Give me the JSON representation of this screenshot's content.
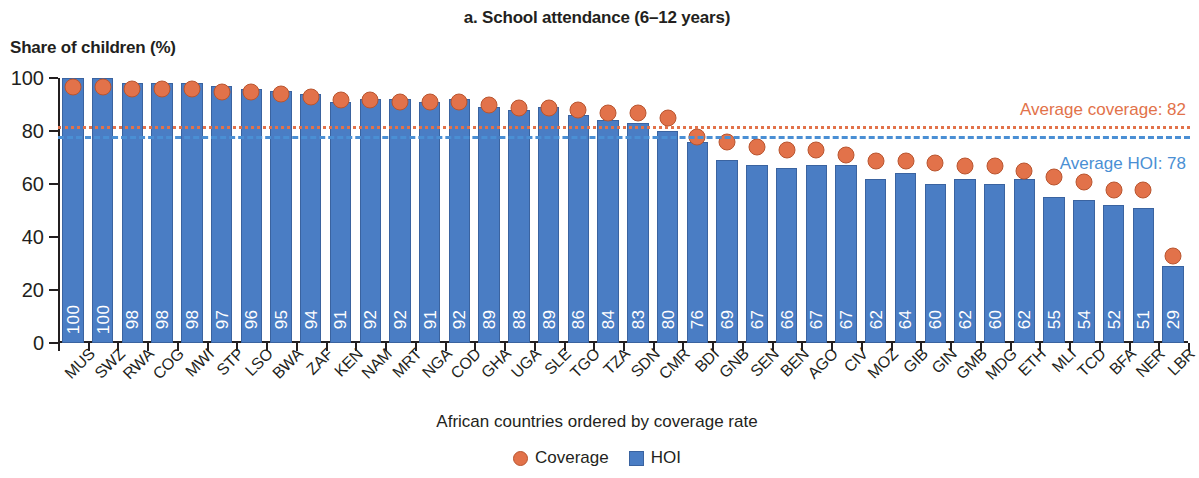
{
  "chart_data": {
    "type": "bar",
    "title": "a. School attendance (6–12 years)",
    "ylabel": "Share of children (%)",
    "xlabel": "African countries ordered by coverage rate",
    "ylim": [
      0,
      100
    ],
    "yticks": [
      0,
      20,
      40,
      60,
      80,
      100
    ],
    "grid": false,
    "legend_position": "bottom-center",
    "categories": [
      "MUS",
      "SWZ",
      "RWA",
      "COG",
      "MWI",
      "STP",
      "LSO",
      "BWA",
      "ZAF",
      "KEN",
      "NAM",
      "MRT",
      "NGA",
      "COD",
      "GHA",
      "UGA",
      "SLE",
      "TGO",
      "TZA",
      "SDN",
      "CMR",
      "BDI",
      "GNB",
      "SEN",
      "BEN",
      "AGO",
      "CIV",
      "MOZ",
      "GIB",
      "GIN",
      "GMB",
      "MDG",
      "ETH",
      "MLI",
      "TCD",
      "BFA",
      "NER",
      "LBR"
    ],
    "series": [
      {
        "name": "HOI",
        "type": "bar",
        "color": "#4a7dc4",
        "values": [
          100,
          100,
          98,
          98,
          98,
          97,
          96,
          95,
          94,
          91,
          92,
          92,
          91,
          92,
          89,
          88,
          89,
          86,
          84,
          83,
          80,
          76,
          69,
          67,
          66,
          67,
          67,
          62,
          64,
          60,
          62,
          60,
          62,
          55,
          54,
          52,
          51,
          29
        ],
        "labels": [
          "100",
          "100",
          "98",
          "98",
          "98",
          "97",
          "96",
          "95",
          "94",
          "91",
          "92",
          "92",
          "91",
          "92",
          "89",
          "88",
          "89",
          "86",
          "84",
          "83",
          "80",
          "76",
          "69",
          "67",
          "66",
          "67",
          "67",
          "62",
          "64",
          "60",
          "62",
          "60",
          "62",
          "55",
          "54",
          "52",
          "51",
          "29"
        ]
      },
      {
        "name": "Coverage",
        "type": "scatter",
        "color": "#e2724a",
        "values": [
          100,
          100,
          99,
          99,
          99,
          98,
          98,
          97,
          96,
          95,
          95,
          94,
          94,
          94,
          93,
          92,
          92,
          91,
          90,
          90,
          88,
          81,
          79,
          77,
          76,
          76,
          74,
          72,
          72,
          71,
          70,
          70,
          68,
          66,
          64,
          61,
          61,
          36
        ]
      }
    ],
    "reference_lines": [
      {
        "name": "Average coverage",
        "value": 82,
        "label": "Average coverage: 82",
        "color": "#e2724a",
        "style": "dotted"
      },
      {
        "name": "Average HOI",
        "value": 78,
        "label": "Average HOI: 78",
        "color": "#4a8fd4",
        "style": "dashed"
      }
    ],
    "legend": [
      {
        "label": "Coverage",
        "marker": "circle",
        "color": "#e2724a"
      },
      {
        "label": "HOI",
        "marker": "square",
        "color": "#4a7dc4"
      }
    ]
  }
}
